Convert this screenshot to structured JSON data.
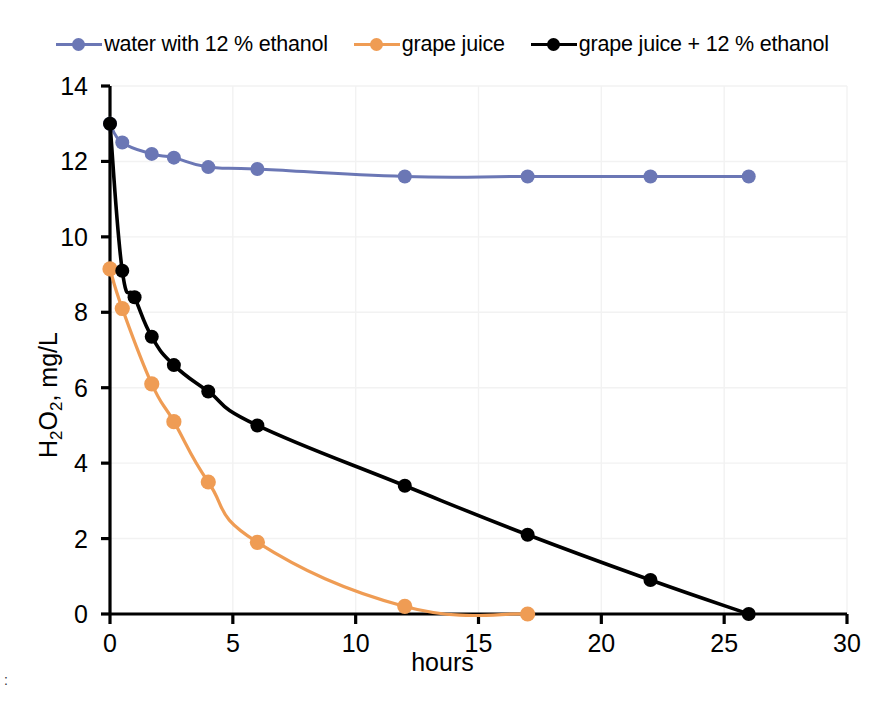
{
  "chart_data": {
    "type": "line",
    "title": "",
    "xlabel": "hours",
    "ylabel": "H2O2, mg/L",
    "ylabel_parts": {
      "pre": "H",
      "sub1": "2",
      "mid": "O",
      "sub2": "2",
      "post": ", mg/L"
    },
    "xlim": [
      0,
      30
    ],
    "ylim": [
      0,
      14
    ],
    "xticks": [
      0,
      5,
      10,
      15,
      20,
      25,
      30
    ],
    "yticks": [
      0,
      2,
      4,
      6,
      8,
      10,
      12,
      14
    ],
    "xtick_labels": [
      "0",
      "5",
      "10",
      "15",
      "20",
      "25",
      "30"
    ],
    "ytick_labels": [
      "0",
      "2",
      "4",
      "6",
      "8",
      "10",
      "12",
      "14"
    ],
    "grid": true,
    "legend_position": "top-center",
    "series": [
      {
        "name": "water with 12 % ethanol",
        "color": "#6b77b5",
        "marker": "circle",
        "x": [
          0,
          0.5,
          1.7,
          2.6,
          4,
          6,
          12,
          17,
          22,
          26
        ],
        "y": [
          13.0,
          12.5,
          12.2,
          12.1,
          11.85,
          11.8,
          11.6,
          11.6,
          11.6,
          11.6
        ]
      },
      {
        "name": "grape juice",
        "color": "#ef9c54",
        "marker": "circle",
        "x": [
          0,
          0.5,
          1.7,
          2.6,
          4,
          6,
          12,
          17
        ],
        "y": [
          9.15,
          8.1,
          6.1,
          5.1,
          3.5,
          1.9,
          0.2,
          0.0
        ]
      },
      {
        "name": "grape juice + 12 % ethanol",
        "color": "#000000",
        "marker": "circle",
        "x": [
          0,
          0.5,
          1.0,
          1.7,
          2.6,
          4,
          6,
          12,
          17,
          22,
          26
        ],
        "y": [
          13.0,
          9.1,
          8.4,
          7.35,
          6.6,
          5.9,
          5.0,
          3.4,
          2.1,
          0.9,
          0.0
        ]
      }
    ]
  },
  "legend": {
    "items": [
      {
        "label": "water with 12 % ethanol",
        "color": "#6b77b5"
      },
      {
        "label": "grape juice",
        "color": "#ef9c54"
      },
      {
        "label": "grape juice + 12 % ethanol",
        "color": "#000000"
      }
    ]
  },
  "axes": {
    "x_title": "hours",
    "y_title": "H2O2, mg/L"
  },
  "colors": {
    "series_blue": "#6b77b5",
    "series_orange": "#ef9c54",
    "series_black": "#000000",
    "axis": "#000000",
    "grid": "#f2f2f2",
    "background": "#ffffff"
  },
  "artifacts": {
    "corner_marks": ":"
  }
}
